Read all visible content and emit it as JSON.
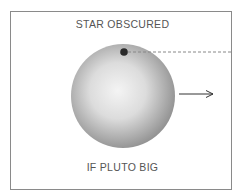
{
  "diagram": {
    "top_label": "STAR OBSCURED",
    "bottom_label": "IF PLUTO BIG",
    "elements": {
      "planet": {
        "name": "pluto-sphere",
        "cx": 123,
        "cy": 96,
        "r": 52
      },
      "star": {
        "name": "star-dot",
        "cx": 124,
        "cy": 52,
        "r": 4
      },
      "sightline": {
        "style": "dashed",
        "x1": 128,
        "y1": 52,
        "x2": 232,
        "y2": 52
      },
      "motion_arrow": {
        "x1": 179,
        "y1": 94,
        "x2": 213,
        "y2": 94,
        "direction": "right"
      }
    },
    "colors": {
      "frame": "#8a8a8a",
      "text": "#555555",
      "sphere_light": "#f2f2f2",
      "sphere_dark": "#8c8c8c",
      "star": "#2a2a2a",
      "dash": "#888888",
      "arrow": "#333333"
    }
  }
}
